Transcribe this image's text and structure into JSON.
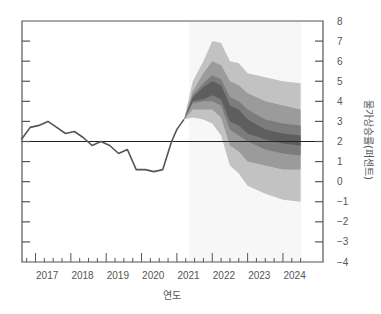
{
  "chart_data": {
    "type": "area",
    "subtype": "fan-chart",
    "title": "",
    "xlabel": "연도",
    "ylabel": "물가상승률(퍼센트)",
    "x_ticks": [
      "2017",
      "2018",
      "2019",
      "2020",
      "2021",
      "2022",
      "2023",
      "2024"
    ],
    "y_ticks": [
      "8",
      "7",
      "6",
      "5",
      "4",
      "3",
      "2",
      "1",
      "0",
      "−1",
      "−2",
      "−3",
      "−4"
    ],
    "xlim": [
      2016.6,
      2024.75
    ],
    "ylim": [
      -4,
      8
    ],
    "grid": false,
    "target_line": 2,
    "projection_start": 2021.2,
    "history": {
      "name": "CPI inflation",
      "x": [
        2016.6,
        2016.85,
        2017.1,
        2017.35,
        2017.6,
        2017.85,
        2018.1,
        2018.35,
        2018.6,
        2018.85,
        2019.1,
        2019.35,
        2019.6,
        2019.85,
        2020.1,
        2020.35,
        2020.6,
        2020.85,
        2021.0,
        2021.2
      ],
      "y": [
        2.1,
        2.7,
        2.8,
        3.0,
        2.7,
        2.4,
        2.5,
        2.2,
        1.8,
        2.0,
        1.8,
        1.4,
        1.6,
        0.6,
        0.6,
        0.5,
        0.6,
        2.0,
        2.6,
        3.1
      ]
    },
    "fan": {
      "x": [
        2021.2,
        2021.45,
        2021.75,
        2022.0,
        2022.25,
        2022.5,
        2022.75,
        2023.0,
        2023.5,
        2024.0,
        2024.5
      ],
      "bands": [
        {
          "name": "outer (90%)",
          "color": "#c2c2c2",
          "upper": [
            3.1,
            5.0,
            6.0,
            7.0,
            6.9,
            6.0,
            5.9,
            5.4,
            5.2,
            5.0,
            4.9
          ],
          "lower": [
            3.1,
            3.2,
            3.1,
            2.9,
            2.3,
            0.8,
            0.4,
            -0.2,
            -0.6,
            -0.9,
            -1.0
          ]
        },
        {
          "name": "middle",
          "color": "#9b9b9b",
          "upper": [
            3.1,
            4.5,
            5.4,
            6.0,
            5.8,
            5.0,
            4.8,
            4.4,
            4.0,
            3.8,
            3.6
          ],
          "lower": [
            3.1,
            3.6,
            3.6,
            3.6,
            3.2,
            1.8,
            1.5,
            1.0,
            0.8,
            0.6,
            0.6
          ]
        },
        {
          "name": "inner",
          "color": "#7c7c7c",
          "upper": [
            3.1,
            4.3,
            4.9,
            5.3,
            5.1,
            4.2,
            4.0,
            3.6,
            3.1,
            2.9,
            2.8
          ],
          "lower": [
            3.1,
            3.9,
            4.0,
            4.0,
            3.8,
            2.6,
            2.3,
            2.0,
            1.6,
            1.4,
            1.3
          ]
        },
        {
          "name": "central",
          "color": "#5e5e5e",
          "upper": [
            3.1,
            4.2,
            4.7,
            5.0,
            4.8,
            3.8,
            3.6,
            3.1,
            2.6,
            2.4,
            2.3
          ],
          "lower": [
            3.1,
            4.0,
            4.1,
            4.3,
            4.1,
            3.0,
            2.8,
            2.4,
            2.1,
            1.9,
            1.8
          ]
        }
      ]
    },
    "colors": {
      "history_line": "#555555",
      "target_line": "#222222",
      "axis": "#555555",
      "projection_bg": "#f7f7f7"
    }
  }
}
